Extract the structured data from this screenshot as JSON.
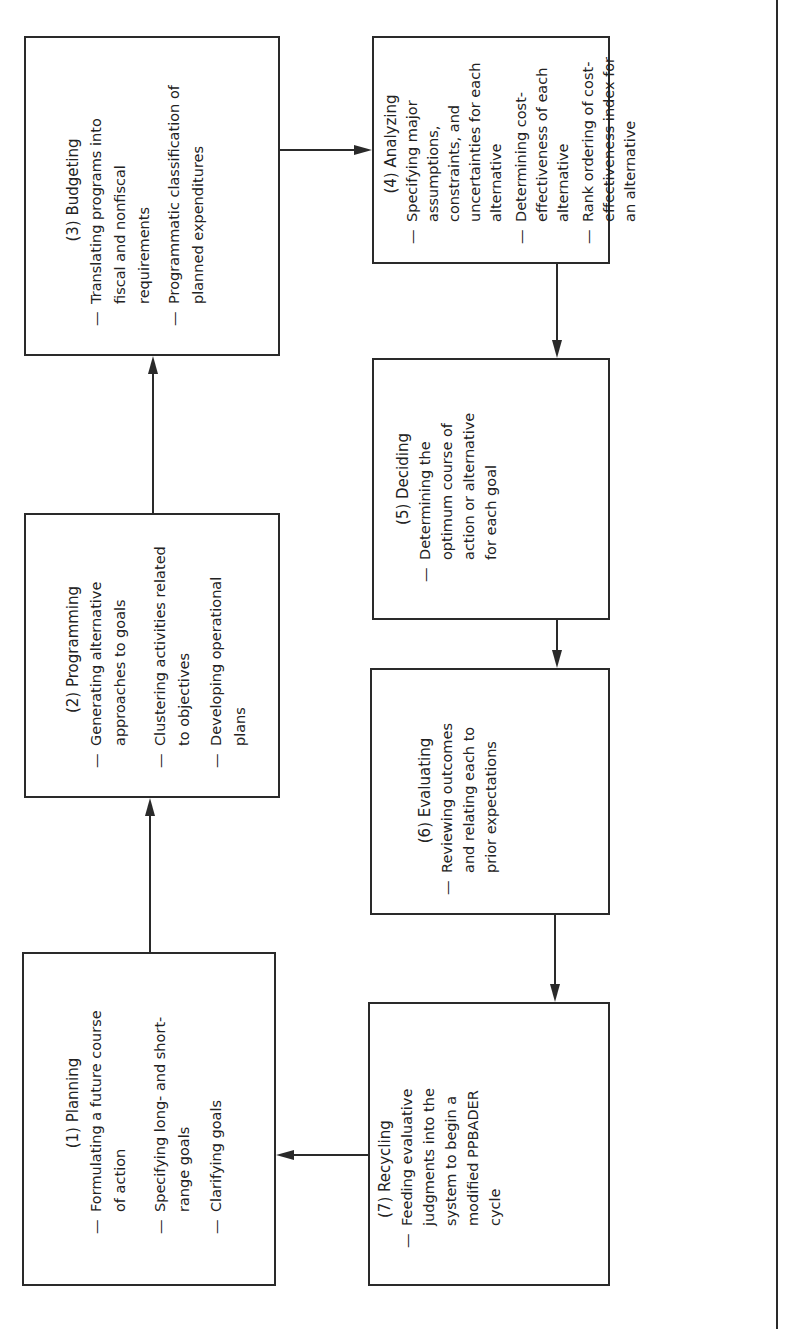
{
  "diagram": {
    "cycle_name": "PPBADER",
    "steps": [
      {
        "id": 1,
        "title": "(1) Planning",
        "items": [
          "Formulating a future course of action",
          "Specifying long- and short-range goals",
          "Clarifying goals"
        ]
      },
      {
        "id": 2,
        "title": "(2) Programming",
        "items": [
          "Generating alternative approaches to goals",
          "Clustering activities related to objectives",
          "Developing operational plans"
        ]
      },
      {
        "id": 3,
        "title": "(3) Budgeting",
        "items": [
          "Translating programs into fiscal and nonfiscal requirements",
          "Programmatic classification of planned expenditures"
        ]
      },
      {
        "id": 4,
        "title": "(4) Analyzing",
        "items": [
          "Specifying major assumptions, constraints, and uncertainties for each alternative",
          "Determining cost-effectiveness of each alternative",
          "Rank ordering of cost-effectiveness index for an alternative"
        ]
      },
      {
        "id": 5,
        "title": "(5) Deciding",
        "items": [
          "Determining the optimum course of action or alternative for each goal"
        ]
      },
      {
        "id": 6,
        "title": "(6) Evaluating",
        "items": [
          "Reviewing outcomes and relating each to prior expectations"
        ]
      },
      {
        "id": 7,
        "title": "(7) Recycling",
        "items": [
          "Feeding evaluative judgments into the system to begin a modified PPBADER cycle"
        ]
      }
    ],
    "dash": "—",
    "flow": [
      "1→2",
      "2→3",
      "3→4",
      "4→5",
      "5→6",
      "6→7",
      "7→1"
    ],
    "line_color": "#2a2a2a"
  }
}
